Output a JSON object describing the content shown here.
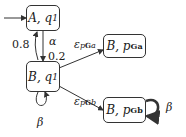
{
  "diagram": {
    "type": "state-transition",
    "nodes": [
      {
        "id": "A_q1",
        "main": "A, q",
        "sub": "1"
      },
      {
        "id": "B_q1",
        "main": "B, q",
        "sub": "1"
      },
      {
        "id": "B_pGa",
        "main": "B, p",
        "sub": "Ga"
      },
      {
        "id": "B_pGb",
        "main": "B, p",
        "sub": "Gb"
      }
    ],
    "edges": [
      {
        "from": "start",
        "to": "A_q1",
        "label": ""
      },
      {
        "from": "A_q1",
        "to": "B_q1",
        "label": "α",
        "prob": "0.2"
      },
      {
        "from": "B_q1",
        "to": "A_q1",
        "label": "",
        "prob": "0.8"
      },
      {
        "from": "B_q1",
        "to": "B_pGa",
        "label": "ε",
        "sub": "pGa"
      },
      {
        "from": "B_q1",
        "to": "B_pGb",
        "label": "ε",
        "sub": "pGb"
      },
      {
        "from": "B_q1",
        "to": "B_q1",
        "label": "β"
      },
      {
        "from": "B_pGb",
        "to": "B_pGb",
        "label": "β"
      }
    ],
    "labels": {
      "alpha": "α",
      "p08": "0.8",
      "p02": "0.2",
      "eps": "ε",
      "eps_a_sub_p": "p",
      "eps_a_sub_G": "G",
      "eps_a_sub_x": "a",
      "eps_b_sub_p": "p",
      "eps_b_sub_G": "G",
      "eps_b_sub_x": "b",
      "beta": "β"
    }
  }
}
